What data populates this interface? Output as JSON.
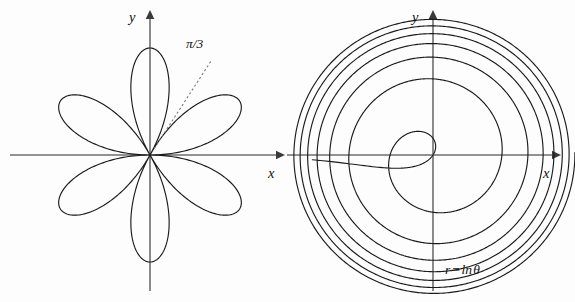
{
  "figure": {
    "title": "",
    "background_color": "#fdfdfd",
    "curve_color": "#1b1b1b",
    "axis_color": "#6e6e6e",
    "label_color": "#111111",
    "ghost_header": "",
    "width": 575,
    "height": 302
  },
  "panels": [
    {
      "id": "left-panel",
      "name": "rose-curve-panel",
      "x_axis_label": "x",
      "y_axis_label": "y",
      "annotation_label": "π/3",
      "equation_label": "",
      "origin": {
        "x": 150,
        "y": 155
      },
      "x_axis": {
        "x1": 10,
        "x2": 285,
        "y": 155,
        "arrow": "right"
      },
      "y_axis": {
        "y1": 10,
        "y2": 291,
        "x": 150,
        "arrow": "up"
      },
      "x_label_pos": {
        "x": 268,
        "y": 178
      },
      "y_label_pos": {
        "x": 129,
        "y": 22
      },
      "annotation_pos": {
        "x": 186,
        "y": 48
      },
      "ray": {
        "angle_deg": 57,
        "r_start": 8,
        "r_end": 112
      }
    },
    {
      "id": "right-panel",
      "name": "log-spiral-panel",
      "x_axis_label": "x",
      "y_axis_label": "y",
      "annotation_label": "",
      "equation_label": "r = ln θ",
      "origin": {
        "x": 433,
        "y": 155
      },
      "x_axis": {
        "x1": 287,
        "x2": 561,
        "y": 155,
        "arrow": "right"
      },
      "y_axis": {
        "y1": 10,
        "y2": 291,
        "x": 433,
        "arrow": "up"
      },
      "x_label_pos": {
        "x": 543,
        "y": 178
      },
      "y_label_pos": {
        "x": 412,
        "y": 22
      },
      "equation_pos": {
        "x": 445,
        "y": 274
      }
    }
  ],
  "chart_data": [
    {
      "type": "line",
      "subtype": "polar-rose",
      "panel": "left-panel",
      "title": "",
      "equation": "r = a sin(3θ)",
      "petals": 6,
      "petal_amplitude_px": 107,
      "petal_angles_deg": [
        30,
        90,
        150,
        210,
        270,
        330
      ],
      "annotation": {
        "text": "π/3",
        "angle_rad_label": "π/3",
        "angle_deg": 60
      },
      "xlabel": "x",
      "ylabel": "y",
      "grid": false,
      "legend": null,
      "theta_range_deg": [
        0,
        360
      ],
      "samples": 720
    },
    {
      "type": "line",
      "subtype": "polar-spiral",
      "panel": "right-panel",
      "title": "",
      "equation": "r = ln θ",
      "xlabel": "x",
      "ylabel": "y",
      "grid": false,
      "legend": null,
      "theta_range_rad": [
        0.04,
        44.0
      ],
      "radial_scale_px_per_unit": 37.5,
      "loops_visible": 6,
      "outer_radius_px": 140,
      "inner_radius_px": 22,
      "samples": 3400
    }
  ]
}
